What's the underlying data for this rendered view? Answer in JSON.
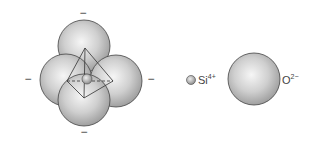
{
  "diagram": {
    "tetrahedron": {
      "charges": [
        "−",
        "−",
        "−",
        "−"
      ],
      "center_ion": "Si4+",
      "corner_ions": "O2-"
    },
    "legend": {
      "si": {
        "symbol": "Si",
        "charge": "4+"
      },
      "o": {
        "symbol": "O",
        "charge": "2−"
      }
    },
    "colors": {
      "sphere_light": "#f4f4f4",
      "sphere_dark": "#9a9a9a",
      "outline": "#333333",
      "text": "#444444"
    }
  }
}
